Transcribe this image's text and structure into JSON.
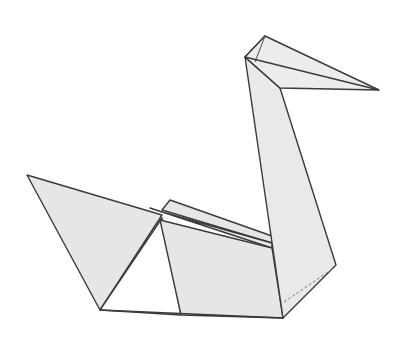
{
  "diagram": {
    "colors": {
      "paper_fill": "#e6e6e6",
      "paper_fill_light": "#ececec",
      "inner_fill": "#ffffff",
      "stroke": "#3a3a3a",
      "fold_dashed": "#7a7a7a"
    },
    "parts": {
      "left_wing": "left-wing",
      "back_flap_top": "back-flap-top",
      "back_flap_middle": "back-flap-middle",
      "body": "body",
      "neck": "neck",
      "head": "head",
      "beak": "beak",
      "dashed_fold": "hidden-fold-line"
    }
  }
}
